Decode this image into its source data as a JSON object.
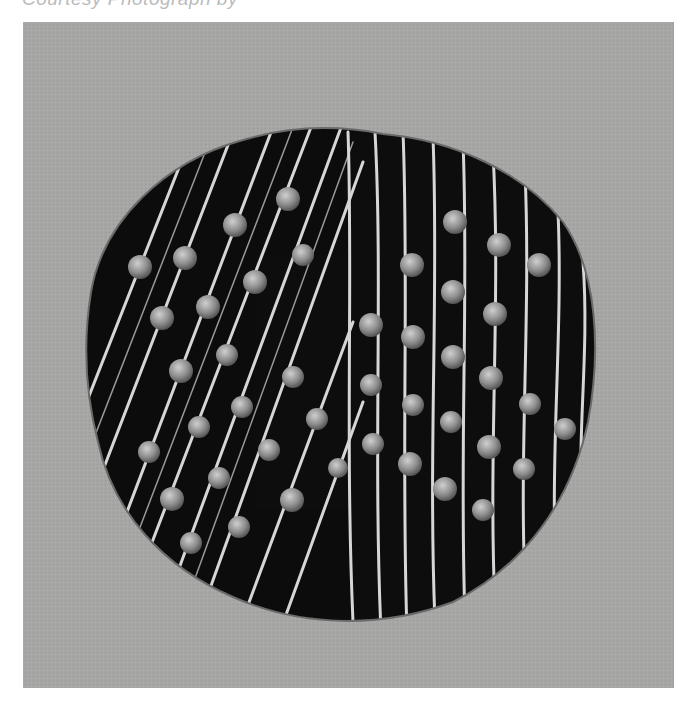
{
  "caption": {
    "text": "Courtesy Photograph by",
    "note": "cropped"
  },
  "photo": {
    "subject": "dark circular disc with grooved ridges and inset round beads",
    "background_color": "#a6a6a4",
    "disc_color": "#0d0d0d",
    "ridge_color": "#d8d8d8",
    "bead_color": "#9a9a9a"
  }
}
